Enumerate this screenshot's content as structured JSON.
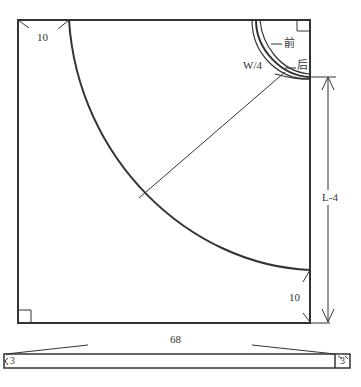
{
  "diagram": {
    "type": "circle skirt pattern draft",
    "labels": {
      "top_left_dim": "10",
      "front": "前",
      "back": "后",
      "waist": "W/4",
      "length": "L-4",
      "bottom_right_dim": "10",
      "waistband_length": "68",
      "waistband_left_end": "3",
      "waistband_right_end": "3"
    },
    "colors": {
      "line": "#333333",
      "background": "#ffffff"
    }
  }
}
